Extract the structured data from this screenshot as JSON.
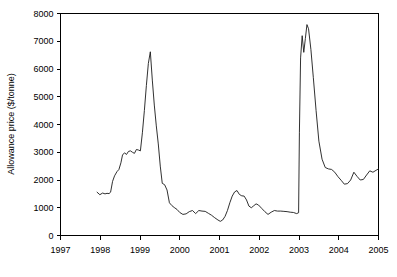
{
  "chart_data": {
    "type": "line",
    "title": "",
    "xlabel": "",
    "ylabel": "Allowance price ($/tonne)",
    "xlim": [
      1997,
      2005
    ],
    "ylim": [
      0,
      8000
    ],
    "grid": false,
    "legend": null,
    "x_ticks": [
      "1997",
      "1998",
      "1999",
      "2000",
      "2001",
      "2002",
      "2003",
      "2004",
      "2005"
    ],
    "x_tick_values": [
      1997,
      1998,
      1999,
      2000,
      2001,
      2002,
      2003,
      2004,
      2005
    ],
    "y_ticks": [
      "0",
      "1000",
      "2000",
      "3000",
      "4000",
      "5000",
      "6000",
      "7000",
      "8000"
    ],
    "y_tick_values": [
      0,
      1000,
      2000,
      3000,
      4000,
      5000,
      6000,
      7000,
      8000
    ],
    "series": [
      {
        "name": "Allowance price",
        "color": "#1a1a1a",
        "x": [
          1997.92,
          1997.99,
          1998.06,
          1998.12,
          1998.17,
          1998.22,
          1998.26,
          1998.31,
          1998.36,
          1998.42,
          1998.47,
          1998.52,
          1998.56,
          1998.61,
          1998.66,
          1998.71,
          1998.76,
          1998.81,
          1998.86,
          1998.91,
          1998.96,
          1999.01,
          1999.06,
          1999.11,
          1999.16,
          1999.21,
          1999.26,
          1999.31,
          1999.36,
          1999.41,
          1999.46,
          1999.51,
          1999.56,
          1999.62,
          1999.68,
          1999.74,
          1999.8,
          1999.86,
          1999.93,
          2000.0,
          2000.08,
          2000.16,
          2000.24,
          2000.32,
          2000.4,
          2000.48,
          2000.56,
          2000.64,
          2000.72,
          2000.8,
          2000.88,
          2000.96,
          2001.02,
          2001.08,
          2001.14,
          2001.2,
          2001.26,
          2001.32,
          2001.38,
          2001.44,
          2001.5,
          2001.56,
          2001.62,
          2001.68,
          2001.74,
          2001.8,
          2001.86,
          2001.92,
          2001.98,
          2002.06,
          2002.14,
          2002.22,
          2002.3,
          2002.38,
          2002.46,
          2002.54,
          2002.62,
          2002.7,
          2002.78,
          2002.86,
          2002.94,
          2002.99,
          2003.01,
          2003.04,
          2003.08,
          2003.12,
          2003.16,
          2003.2,
          2003.24,
          2003.3,
          2003.36,
          2003.43,
          2003.5,
          2003.58,
          2003.66,
          2003.74,
          2003.82,
          2003.9,
          2003.98,
          2004.06,
          2004.14,
          2004.22,
          2004.3,
          2004.38,
          2004.46,
          2004.54,
          2004.62,
          2004.7,
          2004.78,
          2004.86,
          2004.94,
          2005.0
        ],
        "y": [
          1560,
          1470,
          1530,
          1500,
          1520,
          1510,
          1560,
          1950,
          2150,
          2300,
          2380,
          2620,
          2900,
          2980,
          2920,
          3030,
          3050,
          3000,
          2960,
          3100,
          3080,
          3050,
          3700,
          4500,
          5400,
          6200,
          6620,
          5600,
          4700,
          3950,
          3300,
          2500,
          1880,
          1830,
          1640,
          1180,
          1080,
          1010,
          940,
          830,
          760,
          780,
          860,
          900,
          790,
          900,
          880,
          870,
          800,
          730,
          640,
          560,
          510,
          560,
          690,
          900,
          1180,
          1420,
          1570,
          1620,
          1480,
          1430,
          1420,
          1280,
          1060,
          1000,
          1070,
          1140,
          1100,
          980,
          860,
          760,
          840,
          900,
          880,
          880,
          870,
          860,
          840,
          830,
          790,
          820,
          3700,
          6400,
          7200,
          6600,
          7100,
          7600,
          7450,
          6700,
          5700,
          4500,
          3400,
          2750,
          2450,
          2400,
          2380,
          2280,
          2120,
          1990,
          1850,
          1870,
          2000,
          2280,
          2130,
          2000,
          2020,
          2180,
          2330,
          2280,
          2350,
          2400
        ]
      }
    ]
  },
  "axis": {
    "y_title": "Allowance price ($/tonne)"
  }
}
